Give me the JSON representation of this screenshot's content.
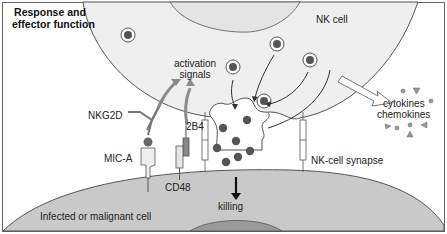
{
  "title": "Response and effector function",
  "title_lines": [
    "Response and",
    "effector function"
  ],
  "labels": {
    "nk_cell": "NK cell",
    "activation_signals": [
      "activation",
      "signals"
    ],
    "cytokines": "cytokines",
    "chemokines": "chemokines",
    "nkg2d": "NKG2D",
    "mic_a": "MIC-A",
    "receptor_2b4": "2B4",
    "cd48": "CD48",
    "nk_cell_synapse": "NK-cell synapse",
    "killing": "killing",
    "target_cell": "Infected or malignant cell"
  },
  "colors": {
    "nk_cell_fill": "#efefef",
    "target_cell_fill": "#c9c9c9",
    "nucleus_fill": "#9a9a9a",
    "granule": "#555555",
    "outline": "#555555",
    "arrow_gray": "#8a8a8a",
    "border": "#666666"
  },
  "granules_in_cell": 5,
  "granules_in_synapse": 7
}
